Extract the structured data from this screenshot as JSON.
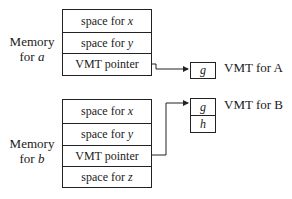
{
  "object_a": {
    "label_line1": "Memory",
    "label_line2_prefix": "for ",
    "label_var": "a",
    "cells": [
      {
        "prefix": "space for ",
        "var": "x"
      },
      {
        "prefix": "space for ",
        "var": "y"
      },
      {
        "text": "VMT pointer"
      }
    ]
  },
  "object_b": {
    "label_line1": "Memory",
    "label_line2_prefix": "for ",
    "label_var": "b",
    "cells": [
      {
        "prefix": "space for ",
        "var": "x"
      },
      {
        "prefix": "space for ",
        "var": "y"
      },
      {
        "text": "VMT pointer"
      },
      {
        "prefix": "space for ",
        "var": "z"
      }
    ]
  },
  "vmt_a": {
    "entries": [
      "g"
    ],
    "label": "VMT for A"
  },
  "vmt_b": {
    "entries": [
      "g",
      "h"
    ],
    "label": "VMT for B"
  }
}
